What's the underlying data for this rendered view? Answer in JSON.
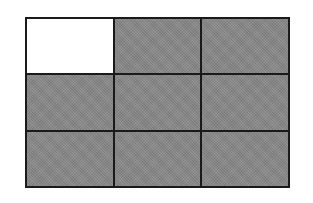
{
  "diagram": {
    "type": "grid",
    "rows": 3,
    "columns": 3,
    "colors": {
      "border": "#1a1a1a",
      "shaded": "#8a8a8a",
      "unshaded": "#ffffff",
      "background": "#ffffff"
    },
    "cells": [
      {
        "row": 1,
        "col": 1,
        "state": "unshaded"
      },
      {
        "row": 1,
        "col": 2,
        "state": "shaded"
      },
      {
        "row": 1,
        "col": 3,
        "state": "shaded"
      },
      {
        "row": 2,
        "col": 1,
        "state": "shaded"
      },
      {
        "row": 2,
        "col": 2,
        "state": "shaded"
      },
      {
        "row": 2,
        "col": 3,
        "state": "shaded"
      },
      {
        "row": 3,
        "col": 1,
        "state": "shaded"
      },
      {
        "row": 3,
        "col": 2,
        "state": "shaded"
      },
      {
        "row": 3,
        "col": 3,
        "state": "shaded"
      }
    ],
    "shaded_count": 8,
    "total_count": 9
  }
}
